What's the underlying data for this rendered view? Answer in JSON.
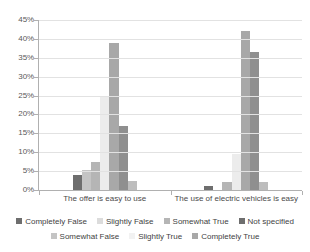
{
  "chart_data": {
    "type": "bar",
    "title": "",
    "subtitle": "",
    "xlabel": "",
    "ylabel": "",
    "ylim": [
      0,
      45
    ],
    "ytick_labels": [
      "0%",
      "5%",
      "10%",
      "15%",
      "20%",
      "25%",
      "30%",
      "35%",
      "40%",
      "45%"
    ],
    "ytick_values": [
      0,
      5,
      10,
      15,
      20,
      25,
      30,
      35,
      40,
      45
    ],
    "grid": true,
    "grid_axis": "y",
    "legend_position": "bottom",
    "value_unit": "%",
    "categories": [
      "The offer is easy to use",
      "The use of electric vehicles is easy"
    ],
    "series": [
      {
        "name": "Completely False",
        "color": "#6e6e6e",
        "values": [
          4.0,
          1.0
        ]
      },
      {
        "name": "Somewhat False",
        "color": "#c4c4c4",
        "values": [
          5.2,
          0.0
        ]
      },
      {
        "name": "Slightly False",
        "color": "#b5b5b5",
        "values": [
          7.5,
          2.0
        ]
      },
      {
        "name": "Slightly True",
        "color": "#ececec",
        "values": [
          24.5,
          9.5
        ]
      },
      {
        "name": "Somewhat True",
        "color": "#e0e0e0",
        "values": [
          9.8,
          9.8
        ]
      },
      {
        "name": "Completely True",
        "color": "#a8a8a8",
        "values": [
          39.0,
          42.0
        ]
      },
      {
        "name": "Not specified",
        "color": "#8f8f8f",
        "values": [
          17.0,
          36.5
        ]
      }
    ],
    "group_bars": [
      {
        "category": "The offer is easy to use",
        "bars": [
          {
            "series": "Completely False",
            "value": 4.0,
            "color": "#6e6e6e"
          },
          {
            "series": "Somewhat False",
            "value": 5.2,
            "color": "#c4c4c4"
          },
          {
            "series": "Slightly False",
            "value": 7.5,
            "color": "#b5b5b5"
          },
          {
            "series": "Slightly True",
            "value": 24.5,
            "color": "#ececec"
          },
          {
            "series": "Somewhat True",
            "value": 39.0,
            "color": "#a8a8a8"
          },
          {
            "series": "Completely True",
            "value": 17.0,
            "color": "#8f8f8f"
          },
          {
            "series": "Not specified",
            "value": 2.5,
            "color": "#bdbdbd"
          }
        ]
      },
      {
        "category": "The use of electric vehicles is easy",
        "bars": [
          {
            "series": "Completely False",
            "value": 1.0,
            "color": "#6e6e6e"
          },
          {
            "series": "Somewhat False",
            "value": 0.0,
            "color": "#c4c4c4"
          },
          {
            "series": "Slightly False",
            "value": 2.0,
            "color": "#b5b5b5"
          },
          {
            "series": "Slightly True",
            "value": 9.5,
            "color": "#ececec"
          },
          {
            "series": "Somewhat True",
            "value": 42.0,
            "color": "#a8a8a8"
          },
          {
            "series": "Completely True",
            "value": 36.5,
            "color": "#8f8f8f"
          },
          {
            "series": "Not specified",
            "value": 2.0,
            "color": "#bdbdbd"
          }
        ]
      }
    ]
  },
  "legend": {
    "row1": [
      {
        "label": "Completely False",
        "color": "#6e6e6e"
      },
      {
        "label": "Slightly False",
        "color": "#dcdcdc"
      },
      {
        "label": "Somewhat True",
        "color": "#b5b5b5"
      },
      {
        "label": "Not specified",
        "color": "#6e6e6e"
      }
    ],
    "row2": [
      {
        "label": "Somewhat False",
        "color": "#c4c4c4"
      },
      {
        "label": "Slightly True",
        "color": "#f2f2f2"
      },
      {
        "label": "Completely True",
        "color": "#a8a8a8"
      }
    ]
  }
}
